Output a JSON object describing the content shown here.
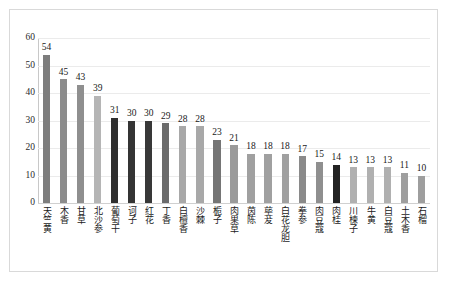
{
  "chart_data": {
    "type": "bar",
    "title": "",
    "xlabel": "",
    "ylabel": "",
    "ylim": [
      0,
      60
    ],
    "ytick_labels": [
      "0",
      "10",
      "20",
      "30",
      "40",
      "50",
      "60"
    ],
    "yticks": [
      0,
      10,
      20,
      30,
      40,
      50,
      60
    ],
    "grid": true,
    "legend": "none",
    "categories": [
      "天竺黄",
      "木香",
      "甘草",
      "北沙参",
      "葡萄干",
      "诃子",
      "红花",
      "丁香",
      "白檀香",
      "沙棘",
      "栀子",
      "肉果草",
      "茵陈",
      "荜茇",
      "白花龙胆",
      "拳参",
      "肉豆蔻",
      "肉桂",
      "川楝子",
      "牛黄",
      "白豆蔻",
      "土木香",
      "石榴"
    ],
    "values": [
      54,
      45,
      43,
      39,
      31,
      30,
      30,
      29,
      28,
      28,
      23,
      21,
      18,
      18,
      18,
      17,
      15,
      14,
      13,
      13,
      13,
      11,
      10
    ],
    "bar_colors": [
      "#7d7d7d",
      "#8c8c8c",
      "#8f8f8f",
      "#b5b5b5",
      "#2f2f2f",
      "#343434",
      "#383838",
      "#6b6b6b",
      "#a8a8a8",
      "#a8a8a8",
      "#757575",
      "#9a9a9a",
      "#a0a0a0",
      "#a0a0a0",
      "#a0a0a0",
      "#8a8a8a",
      "#8f8f8f",
      "#232323",
      "#b0b0b0",
      "#b0b0b0",
      "#b0b0b0",
      "#9e9e9e",
      "#9e9e9e"
    ],
    "value_labels": [
      "54",
      "45",
      "43",
      "39",
      "31",
      "30",
      "30",
      "29",
      "28",
      "28",
      "23",
      "21",
      "18",
      "18",
      "18",
      "17",
      "15",
      "14",
      "13",
      "13",
      "13",
      "11",
      "10"
    ]
  },
  "frame": {
    "border_color": "#d9d9d9",
    "background": "#ffffff",
    "gridline_color": "#ebebeb"
  }
}
